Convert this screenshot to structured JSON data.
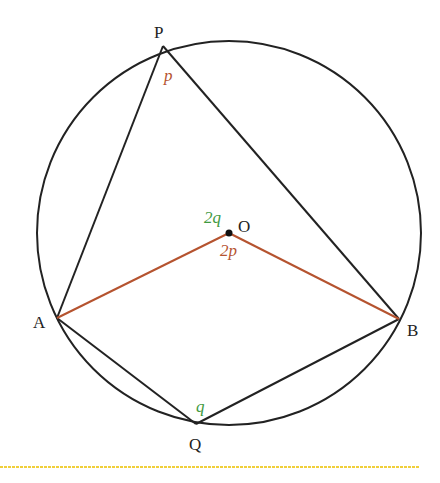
{
  "diagram": {
    "colors": {
      "stroke": "#222222",
      "radius": "#b5532f",
      "angle_p": "#b5532f",
      "angle_q": "#3f9a3f",
      "rule": "#f0cf3a"
    },
    "points": {
      "P": {
        "label": "P"
      },
      "O": {
        "label": "O"
      },
      "A": {
        "label": "A"
      },
      "B": {
        "label": "B"
      },
      "Q": {
        "label": "Q"
      }
    },
    "angles": {
      "at_P": "p",
      "at_O_upper": "2q",
      "at_O_lower": "2p",
      "at_Q": "q"
    }
  }
}
